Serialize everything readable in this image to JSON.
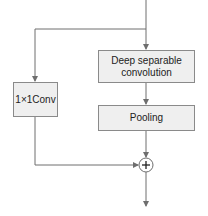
{
  "diagram": {
    "nodes": {
      "depthwise": {
        "label_line1": "Deep separable",
        "label_line2": "convolution"
      },
      "pooling": {
        "label": "Pooling"
      },
      "conv1x1": {
        "label": "1×1Conv"
      },
      "add": {
        "symbol": "+",
        "icon": "plus-circle-icon"
      }
    },
    "edges": [
      {
        "from": "input",
        "to": "depthwise"
      },
      {
        "from": "input",
        "to": "conv1x1"
      },
      {
        "from": "depthwise",
        "to": "pooling"
      },
      {
        "from": "pooling",
        "to": "add"
      },
      {
        "from": "conv1x1",
        "to": "add"
      },
      {
        "from": "add",
        "to": "output"
      }
    ],
    "colors": {
      "line": "#6e6e6e",
      "box_fill": "#efefef",
      "box_border": "#8a8a8a"
    }
  }
}
